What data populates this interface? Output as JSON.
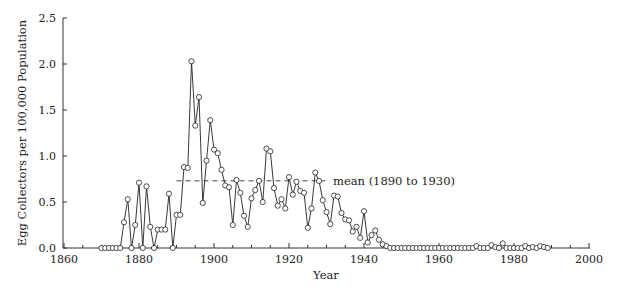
{
  "chart_data": {
    "type": "line",
    "title": "",
    "xlabel": "Year",
    "ylabel": "Egg Collectors per 100,000 Population",
    "xlim": [
      1855,
      2000
    ],
    "ylim": [
      0,
      2.5
    ],
    "xticks": [
      1860,
      1880,
      1900,
      1920,
      1940,
      1960,
      1980,
      2000
    ],
    "xticks_minor_step": 5,
    "yticks": [
      0.0,
      0.5,
      1.0,
      1.5,
      2.0,
      2.5
    ],
    "grid": false,
    "legend": null,
    "marker": "open-circle",
    "series": [
      {
        "name": "Egg collectors",
        "x": [
          1870,
          1871,
          1872,
          1873,
          1874,
          1875,
          1876,
          1877,
          1878,
          1879,
          1880,
          1881,
          1882,
          1883,
          1884,
          1885,
          1886,
          1887,
          1888,
          1889,
          1890,
          1891,
          1892,
          1893,
          1894,
          1895,
          1896,
          1897,
          1898,
          1899,
          1900,
          1901,
          1902,
          1903,
          1904,
          1905,
          1906,
          1907,
          1908,
          1909,
          1910,
          1911,
          1912,
          1913,
          1914,
          1915,
          1916,
          1917,
          1918,
          1919,
          1920,
          1921,
          1922,
          1923,
          1924,
          1925,
          1926,
          1927,
          1928,
          1929,
          1930,
          1931,
          1932,
          1933,
          1934,
          1935,
          1936,
          1937,
          1938,
          1939,
          1940,
          1941,
          1942,
          1943,
          1944,
          1945,
          1946,
          1947,
          1948,
          1949,
          1950,
          1951,
          1952,
          1953,
          1954,
          1955,
          1956,
          1957,
          1958,
          1959,
          1960,
          1961,
          1962,
          1963,
          1964,
          1965,
          1966,
          1967,
          1968,
          1969,
          1970,
          1971,
          1972,
          1973,
          1974,
          1975,
          1976,
          1977,
          1978,
          1979,
          1980,
          1981,
          1982,
          1983,
          1984,
          1985,
          1986,
          1987,
          1988,
          1989
        ],
        "values": [
          0,
          0,
          0,
          0,
          0,
          0,
          0.28,
          0.53,
          0,
          0.25,
          0.71,
          0,
          0.67,
          0.23,
          0,
          0.2,
          0.2,
          0.2,
          0.59,
          0,
          0.36,
          0.36,
          0.88,
          0.87,
          2.03,
          1.33,
          1.64,
          0.49,
          0.95,
          1.39,
          1.07,
          1.03,
          0.85,
          0.68,
          0.66,
          0.25,
          0.74,
          0.6,
          0.35,
          0.23,
          0.54,
          0.63,
          0.73,
          0.5,
          1.08,
          1.05,
          0.65,
          0.46,
          0.53,
          0.43,
          0.77,
          0.58,
          0.72,
          0.62,
          0.6,
          0.22,
          0.43,
          0.82,
          0.73,
          0.52,
          0.39,
          0.26,
          0.57,
          0.56,
          0.38,
          0.31,
          0.3,
          0.18,
          0.23,
          0.11,
          0.4,
          0.06,
          0.14,
          0.19,
          0.09,
          0.04,
          0.02,
          0,
          0,
          0,
          0,
          0,
          0,
          0,
          0,
          0,
          0,
          0,
          0,
          0,
          0,
          0,
          0,
          0,
          0,
          0,
          0,
          0,
          0,
          0,
          0.02,
          0,
          0,
          0,
          0.03,
          0.01,
          0,
          0.05,
          0,
          0,
          0,
          0,
          0,
          0.02,
          0,
          0.01,
          0,
          0.02,
          0.01,
          0
        ]
      }
    ],
    "annotations": [
      {
        "type": "hline",
        "y": 0.73,
        "x_from": 1890,
        "x_to": 1930,
        "style": "dashed",
        "label": "mean (1890 to 1930)"
      }
    ]
  }
}
